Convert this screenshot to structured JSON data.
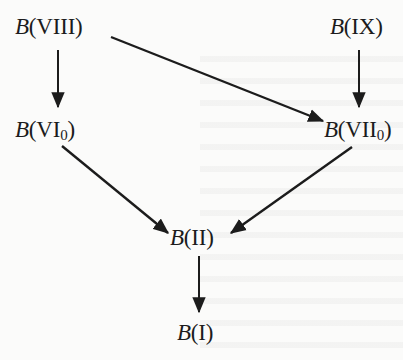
{
  "diagram": {
    "type": "directed-graph",
    "nodes": [
      {
        "id": "viii",
        "prefix": "B",
        "label": "(VIII)",
        "sub": ""
      },
      {
        "id": "ix",
        "prefix": "B",
        "label": "(IX)",
        "sub": ""
      },
      {
        "id": "vi0",
        "prefix": "B",
        "label": "(VI",
        "sub": "0",
        "close": ")"
      },
      {
        "id": "vii0",
        "prefix": "B",
        "label": "(VII",
        "sub": "0",
        "close": ")"
      },
      {
        "id": "ii",
        "prefix": "B",
        "label": "(II)",
        "sub": ""
      },
      {
        "id": "i",
        "prefix": "B",
        "label": "(I)",
        "sub": ""
      }
    ],
    "edges": [
      {
        "from": "viii",
        "to": "vi0"
      },
      {
        "from": "viii",
        "to": "vii0"
      },
      {
        "from": "ix",
        "to": "vii0"
      },
      {
        "from": "vi0",
        "to": "ii"
      },
      {
        "from": "vii0",
        "to": "ii"
      },
      {
        "from": "ii",
        "to": "i"
      }
    ],
    "colors": {
      "ink": "#1c1c1c",
      "paper": "#fbfbfa"
    }
  }
}
